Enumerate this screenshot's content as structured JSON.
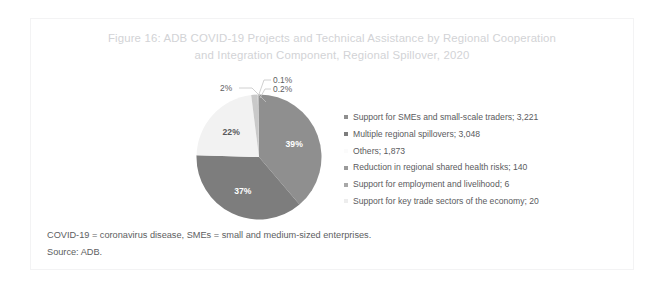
{
  "figure": {
    "title": "Figure 16: ADB COVID-19 Projects and Technical Assistance by Regional Cooperation\nand Integration Component, Regional Spillover, 2020",
    "frame_color": "#f3f3f4",
    "background": "#ffffff"
  },
  "chart_data": {
    "type": "pie",
    "title": "ADB COVID-19 Projects and Technical Assistance by Regional Cooperation and Integration Component, Regional Spillover, 2020",
    "legend_position": "right",
    "total": 8308,
    "categories": [
      "Support for SMEs and small-scale traders",
      "Multiple regional spillovers",
      "Others",
      "Reduction in regional shared health risks",
      "Support for employment and livelihood",
      "Support for key trade sectors of the economy"
    ],
    "values": [
      3221,
      3048,
      1873,
      140,
      6,
      20
    ],
    "percent_labels": [
      "39%",
      "37%",
      "22%",
      "2%",
      "0.1%",
      "0.2%"
    ],
    "percentages": [
      38.8,
      36.7,
      22.5,
      1.7,
      0.07,
      0.24
    ],
    "colors": [
      "#8f8f8f",
      "#7d7d7d",
      "#f2f2f2",
      "#c9c9c9",
      "#e4e4e4",
      "#b4b4b4"
    ],
    "slice_label_inside": [
      "39%",
      "37%",
      "22%"
    ],
    "slice_label_callout": [
      "2%",
      "0.1%",
      "0.2%"
    ]
  },
  "legend": {
    "items": [
      {
        "label": "Support for SMEs and small-scale traders; 3,221",
        "color": "#8f8f8f"
      },
      {
        "label": "Multiple regional spillovers; 3,048",
        "color": "#7d7d7d"
      },
      {
        "label": "Others; 1,873",
        "color": "#fbfbfb"
      },
      {
        "label": "Reduction in regional shared health risks; 140",
        "color": "#9a9a9a"
      },
      {
        "label": "Support for employment and livelihood; 6",
        "color": "#a8a8a8"
      },
      {
        "label": "Support for key trade sectors of the economy; 20",
        "color": "#ededed"
      }
    ]
  },
  "callouts": {
    "two_percent": "2%",
    "zero_one_percent": "0.1%",
    "zero_two_percent": "0.2%"
  },
  "slice_labels": {
    "first": "39%",
    "second": "37%",
    "third": "22%"
  },
  "footnotes": {
    "definitions": "COVID-19 = coronavirus disease, SMEs = small and medium-sized enterprises.",
    "source": "Source: ADB."
  }
}
